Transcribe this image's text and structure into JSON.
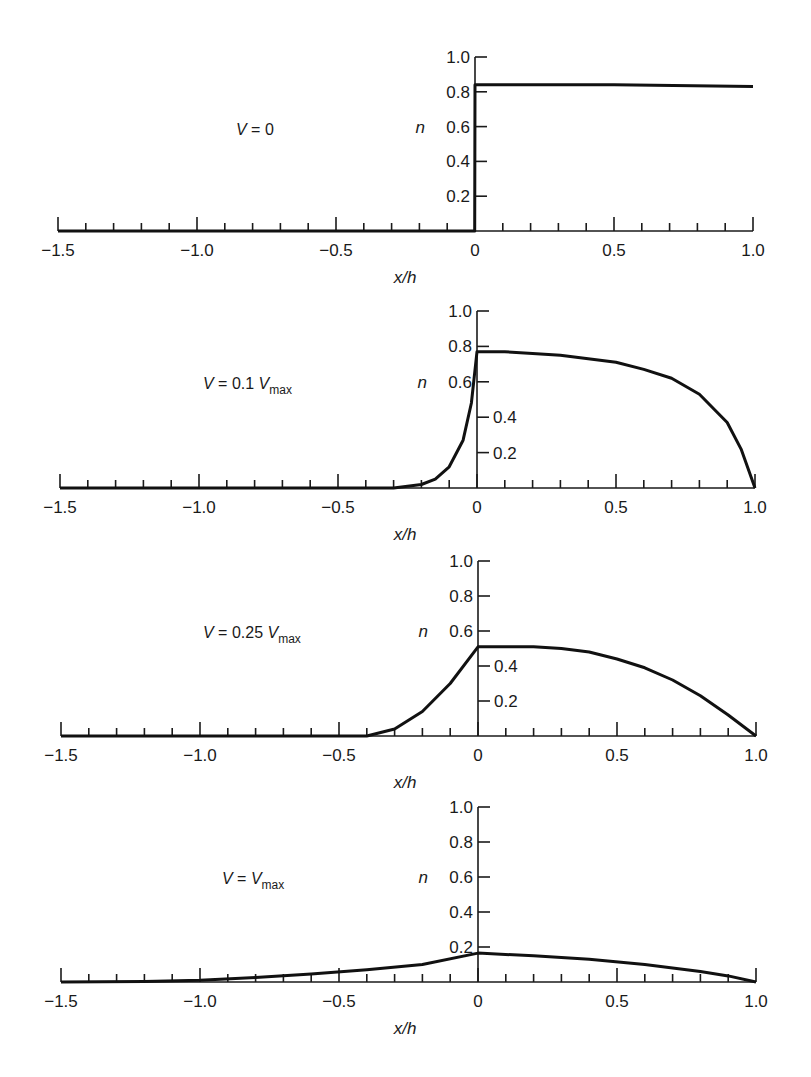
{
  "chart_data": [
    {
      "type": "line",
      "panel_label": "V = 0",
      "label_main": "V = 0",
      "label_sub": "",
      "xlabel": "x/h",
      "ylabel": "n",
      "xlim": [
        -1.5,
        1.0
      ],
      "ylim": [
        0,
        1.0
      ],
      "x_tick_labels": [
        "−1.5",
        "−1.0",
        "−0.5",
        "0",
        "0.5",
        "1.0"
      ],
      "y_tick_labels": [
        "0.2",
        "0.4",
        "0.6",
        "0.8",
        "1.0"
      ],
      "y_tick_side": [
        "left",
        "left",
        "left",
        "left",
        "left"
      ],
      "series": [
        {
          "name": "n(x/h)",
          "x": [
            -1.5,
            -0.001,
            0,
            0.5,
            1.0
          ],
          "y": [
            0,
            0,
            0.84,
            0.84,
            0.83
          ]
        }
      ]
    },
    {
      "type": "line",
      "panel_label": "V = 0.1 Vmax",
      "label_main": "V = 0.1 V",
      "label_sub": "max",
      "xlabel": "x/h",
      "ylabel": "n",
      "xlim": [
        -1.5,
        1.0
      ],
      "ylim": [
        0,
        1.0
      ],
      "x_tick_labels": [
        "−1.5",
        "−1.0",
        "−0.5",
        "0",
        "0.5",
        "1.0"
      ],
      "y_tick_labels": [
        "0.2",
        "0.4",
        "0.6",
        "0.8",
        "1.0"
      ],
      "y_tick_side": [
        "right",
        "right",
        "left",
        "left",
        "left"
      ],
      "series": [
        {
          "name": "n(x/h)",
          "x": [
            -1.5,
            -0.3,
            -0.2,
            -0.15,
            -0.1,
            -0.05,
            -0.02,
            0,
            0.1,
            0.2,
            0.3,
            0.4,
            0.5,
            0.6,
            0.7,
            0.8,
            0.9,
            0.95,
            1.0
          ],
          "y": [
            0,
            0,
            0.02,
            0.05,
            0.12,
            0.27,
            0.48,
            0.77,
            0.77,
            0.76,
            0.75,
            0.73,
            0.71,
            0.67,
            0.62,
            0.53,
            0.37,
            0.22,
            0.0
          ]
        }
      ]
    },
    {
      "type": "line",
      "panel_label": "V = 0.25 Vmax",
      "label_main": "V = 0.25 V",
      "label_sub": "max",
      "xlabel": "x/h",
      "ylabel": "n",
      "xlim": [
        -1.5,
        1.0
      ],
      "ylim": [
        0,
        1.0
      ],
      "x_tick_labels": [
        "−1.5",
        "−1.0",
        "−0.5",
        "0",
        "0.5",
        "1.0"
      ],
      "y_tick_labels": [
        "0.2",
        "0.4",
        "0.6",
        "0.8",
        "1.0"
      ],
      "y_tick_side": [
        "right",
        "right",
        "left",
        "left",
        "left"
      ],
      "series": [
        {
          "name": "n(x/h)",
          "x": [
            -1.5,
            -0.4,
            -0.3,
            -0.2,
            -0.1,
            0,
            0.1,
            0.2,
            0.3,
            0.4,
            0.5,
            0.6,
            0.7,
            0.8,
            0.9,
            1.0
          ],
          "y": [
            0,
            0,
            0.04,
            0.14,
            0.3,
            0.51,
            0.51,
            0.51,
            0.5,
            0.48,
            0.44,
            0.39,
            0.32,
            0.23,
            0.12,
            0.0
          ]
        }
      ]
    },
    {
      "type": "line",
      "panel_label": "V = Vmax",
      "label_main": "V = V",
      "label_sub": "max",
      "xlabel": "x/h",
      "ylabel": "n",
      "xlim": [
        -1.5,
        1.0
      ],
      "ylim": [
        0,
        1.0
      ],
      "x_tick_labels": [
        "−1.5",
        "−1.0",
        "−0.5",
        "0",
        "0.5",
        "1.0"
      ],
      "y_tick_labels": [
        "0.2",
        "0.4",
        "0.6",
        "0.8",
        "1.0"
      ],
      "y_tick_side": [
        "left",
        "left",
        "left",
        "left",
        "left"
      ],
      "series": [
        {
          "name": "n(x/h)",
          "x": [
            -1.5,
            -1.2,
            -1.0,
            -0.8,
            -0.6,
            -0.4,
            -0.2,
            0,
            0.2,
            0.4,
            0.6,
            0.8,
            0.9,
            1.0
          ],
          "y": [
            0,
            0.003,
            0.01,
            0.025,
            0.045,
            0.07,
            0.1,
            0.165,
            0.15,
            0.13,
            0.1,
            0.06,
            0.035,
            0.0
          ]
        }
      ]
    }
  ],
  "panels_layout": [
    {
      "x0": 475,
      "y_base": 231,
      "y_top": 57,
      "label_x": 236,
      "label_y": 129
    },
    {
      "x0": 477,
      "y_base": 488,
      "y_top": 311,
      "label_x": 203,
      "label_y": 383
    },
    {
      "x0": 478,
      "y_base": 736,
      "y_top": 561,
      "label_x": 203,
      "label_y": 632
    },
    {
      "x0": 478,
      "y_base": 982,
      "y_top": 807,
      "label_x": 222,
      "label_y": 878
    }
  ]
}
